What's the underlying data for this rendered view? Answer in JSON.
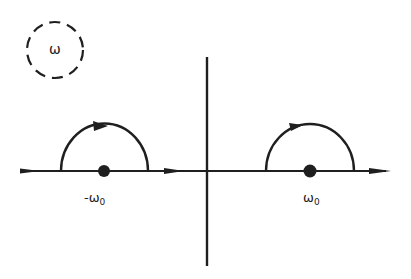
{
  "diagram": {
    "type": "complex-plane contour",
    "plane_label": "ω",
    "colors": {
      "ink": "#1f1f1f",
      "background": "#ffffff"
    },
    "axes": {
      "real_axis": {
        "y": 171,
        "x_start": 20,
        "x_end": 390,
        "direction": "right"
      },
      "imag_axis": {
        "x": 207,
        "y_start": 57,
        "y_end": 266
      }
    },
    "poles": [
      {
        "label_main": "-ω",
        "label_sub": "0",
        "x": 104,
        "y": 171
      },
      {
        "label_main": "ω",
        "label_sub": "0",
        "x": 310,
        "y": 171
      }
    ],
    "indentations": [
      {
        "shape": "upper semicircle",
        "center_x": 104,
        "radius": 43,
        "arrow": "clockwise (left-to-right over pole)"
      },
      {
        "shape": "upper semicircle",
        "center_x": 310,
        "radius": 44,
        "arrow": "clockwise (left-to-right over pole)"
      }
    ],
    "labels": {
      "plane": "ω",
      "neg_pole_main": "-ω",
      "neg_pole_sub": "0",
      "pos_pole_main": "ω",
      "pos_pole_sub": "0"
    }
  }
}
